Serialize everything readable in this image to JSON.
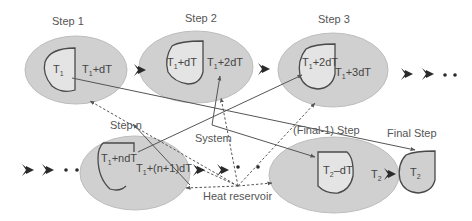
{
  "diagram": {
    "colors": {
      "ellipse_fill": "#d0d0d0",
      "ellipse_stroke": "#bdbdbd",
      "system_fill": "#e4e4e4",
      "system_stroke": "#4a4a4a",
      "arrow": "#2a2a2a",
      "line": "#555555",
      "text": "#555555"
    },
    "steps": [
      {
        "label": "Step 1",
        "system": {
          "base": "T",
          "sub": "1",
          "rest": ""
        },
        "reservoir": {
          "base": "T",
          "sub": "1",
          "rest": "+dT"
        }
      },
      {
        "label": "Step 2",
        "system": {
          "base": "T",
          "sub": "1",
          "rest": "+dT"
        },
        "reservoir": {
          "base": "T",
          "sub": "1",
          "rest": "+2dT"
        }
      },
      {
        "label": "Step 3",
        "system": {
          "base": "T",
          "sub": "1",
          "rest": "+2dT"
        },
        "reservoir": {
          "base": "T",
          "sub": "1",
          "rest": "+3dT"
        }
      },
      {
        "label": "Step n",
        "system": {
          "base": "T",
          "sub": "1",
          "rest": "+ndT"
        },
        "reservoir": {
          "base": "T",
          "sub": "1",
          "rest": "+(n+1)dT"
        }
      },
      {
        "label": "(Final-1) Step",
        "system": {
          "base": "T",
          "sub": "2",
          "rest": "–dT"
        },
        "reservoir": {
          "base": "T",
          "sub": "2",
          "rest": ""
        }
      },
      {
        "label": "Final Step",
        "system": {
          "base": "T",
          "sub": "2",
          "rest": ""
        }
      }
    ],
    "annotations": {
      "system": "System",
      "heat_reservoir": "Heat reservoir"
    },
    "icons": {
      "progress_arrow": "chevron-arrow-right-icon",
      "ellipsis": "dots-icon"
    }
  }
}
